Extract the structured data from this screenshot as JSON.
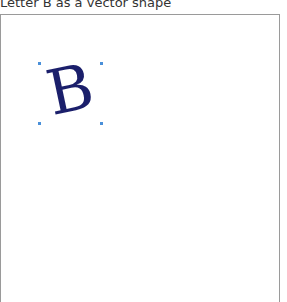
{
  "header": {
    "title": "Letter B as a vector shape"
  },
  "canvas": {
    "shape": {
      "letter": "B",
      "fill_color": "#1b1f6b",
      "selected": true,
      "handle_color": "#4a90d9"
    }
  }
}
